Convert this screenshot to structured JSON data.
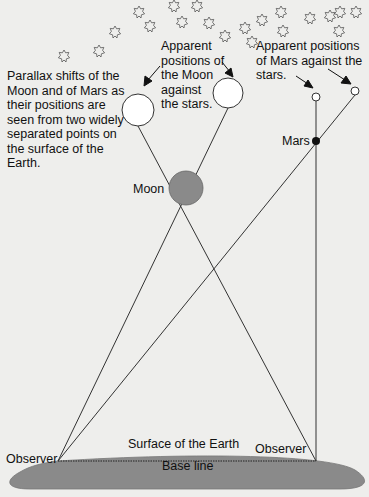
{
  "diagram": {
    "captions": {
      "parallax": "Parallax shifts of the\nMoon and of Mars as\ntheir positions are\nseen from two widely\nseparated points on\nthe surface of the\nEarth.",
      "moon_apparent": "Apparent\npositions of\nthe Moon\nagainst\nthe stars.",
      "mars_apparent": "Apparent positions\nof Mars against the\nstars."
    },
    "labels": {
      "moon": "Moon",
      "mars": "Mars",
      "observer_left": "Observer",
      "observer_right": "Observer",
      "surface": "Surface of the Earth",
      "baseline": "Base line"
    },
    "colors": {
      "background": "#eeeeec",
      "earth": "#8a8a8a",
      "moon_fill": "#8a8a8a",
      "mars_fill": "#111111",
      "line": "#333333",
      "star": "#555555"
    },
    "objects": {
      "observer_left": {
        "x": 58,
        "y": 461
      },
      "observer_right": {
        "x": 316,
        "y": 461
      },
      "moon": {
        "x": 186,
        "y": 188,
        "r": 17
      },
      "moon_apparent_left": {
        "x": 138,
        "y": 110,
        "r": 16
      },
      "moon_apparent_right": {
        "x": 228,
        "y": 93,
        "r": 15
      },
      "mars": {
        "x": 316,
        "y": 141,
        "r": 4
      },
      "mars_apparent_left": {
        "x": 316,
        "y": 97,
        "r": 4
      },
      "mars_apparent_right": {
        "x": 355,
        "y": 91,
        "r": 4
      }
    }
  }
}
